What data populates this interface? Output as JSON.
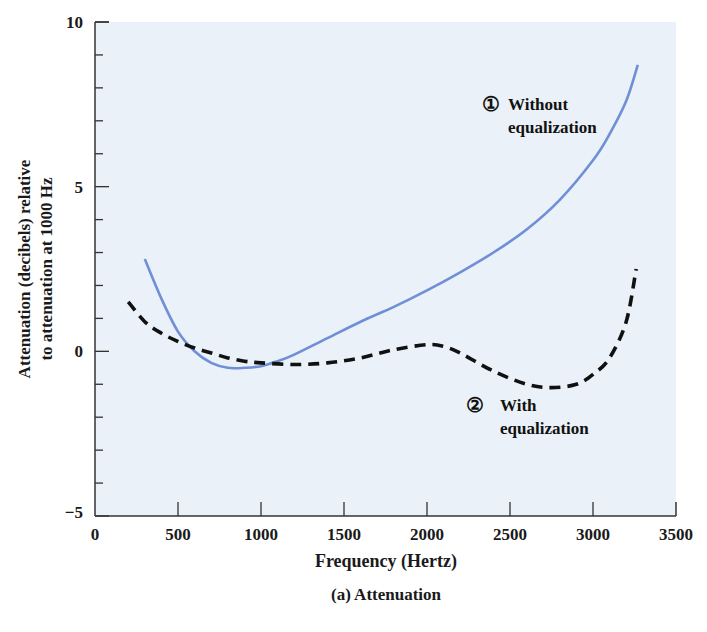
{
  "colors": {
    "plot_background": "#eaf1f8",
    "axis": "#333333",
    "series_without": "#6f8fd6",
    "series_with": "#111111"
  },
  "chart_data": {
    "type": "line",
    "title": "",
    "caption": "(a) Attenuation",
    "xlabel": "Frequency (Hertz)",
    "ylabel_line1": "Attenuation (decibels) relative",
    "ylabel_line2": "to attenuation at 1000 Hz",
    "xlim": [
      0,
      3500
    ],
    "ylim": [
      -5,
      10
    ],
    "x_ticks": [
      0,
      500,
      1000,
      1500,
      2000,
      2500,
      3000,
      3500
    ],
    "y_ticks_labeled": [
      -5,
      0,
      5,
      10
    ],
    "y_minor_step": 1,
    "grid": false,
    "series": [
      {
        "name": "Without equalization",
        "marker_label": "①",
        "style": "solid",
        "x": [
          300,
          400,
          500,
          600,
          700,
          800,
          900,
          1000,
          1100,
          1200,
          1400,
          1600,
          1800,
          2000,
          2200,
          2400,
          2600,
          2800,
          3000,
          3100,
          3200,
          3270
        ],
        "y": [
          2.8,
          1.6,
          0.6,
          0.0,
          -0.35,
          -0.5,
          -0.5,
          -0.45,
          -0.3,
          -0.1,
          0.4,
          0.9,
          1.35,
          1.85,
          2.4,
          3.0,
          3.7,
          4.6,
          5.8,
          6.6,
          7.6,
          8.7
        ]
      },
      {
        "name": "With equalization",
        "marker_label": "②",
        "style": "dashed",
        "x": [
          200,
          300,
          400,
          500,
          600,
          700,
          800,
          900,
          1000,
          1200,
          1400,
          1600,
          1800,
          2000,
          2100,
          2200,
          2400,
          2600,
          2750,
          2900,
          3000,
          3100,
          3200,
          3260
        ],
        "y": [
          1.5,
          0.9,
          0.55,
          0.3,
          0.1,
          -0.05,
          -0.2,
          -0.3,
          -0.35,
          -0.4,
          -0.35,
          -0.2,
          0.05,
          0.2,
          0.15,
          -0.05,
          -0.6,
          -1.0,
          -1.1,
          -1.0,
          -0.7,
          -0.2,
          0.9,
          2.5
        ]
      }
    ],
    "annotations": [
      {
        "marker": "①",
        "line1": "Without",
        "line2": "equalization"
      },
      {
        "marker": "②",
        "line1": "With",
        "line2": "equalization"
      }
    ]
  }
}
